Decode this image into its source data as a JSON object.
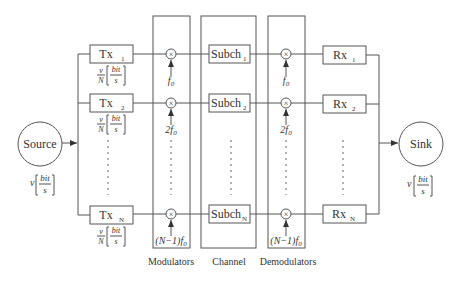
{
  "diagram": {
    "source": {
      "label": "Source",
      "rate_prefix": "v",
      "rate_num": "bit",
      "rate_den": "s"
    },
    "sink": {
      "label": "Sink",
      "rate_prefix": "v",
      "rate_num": "bit",
      "rate_den": "s"
    },
    "transmitters": [
      {
        "label": "Tx",
        "sub": "1",
        "rate_num_v": "v",
        "rate_den_N": "N",
        "rate_num": "bit",
        "rate_den": "s"
      },
      {
        "label": "Tx",
        "sub": "2",
        "rate_num_v": "v",
        "rate_den_N": "N",
        "rate_num": "bit",
        "rate_den": "s"
      },
      {
        "label": "Tx",
        "sub": "N",
        "rate_num_v": "v",
        "rate_den_N": "N",
        "rate_num": "bit",
        "rate_den": "s"
      }
    ],
    "modulators": {
      "group_label": "Modulators",
      "mixer_symbol": "×",
      "freqs": [
        "f",
        "2f",
        "(N−1)f"
      ],
      "freq_sub": "0"
    },
    "channel": {
      "group_label": "Channel",
      "subchannels": [
        {
          "label": "Subch",
          "sub": "1"
        },
        {
          "label": "Subch",
          "sub": "2"
        },
        {
          "label": "Subch",
          "sub": "N"
        }
      ]
    },
    "demodulators": {
      "group_label": "Demodulators",
      "mixer_symbol": "×",
      "freqs": [
        "f",
        "2f",
        "(N−1)f"
      ],
      "freq_sub": "0"
    },
    "receivers": [
      {
        "label": "Rx",
        "sub": "1"
      },
      {
        "label": "Rx",
        "sub": "2"
      },
      {
        "label": "Rx",
        "sub": "N"
      }
    ]
  }
}
